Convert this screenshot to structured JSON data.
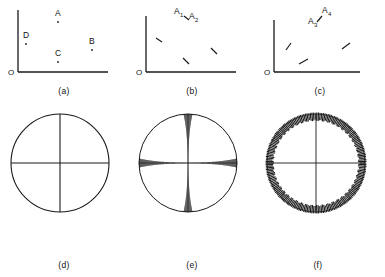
{
  "figure": {
    "title": "",
    "background_color": "#ffffff",
    "ink_color": "#1a1a1a",
    "panel_count": 6
  },
  "panels": [
    {
      "id": "a",
      "caption": "(a)",
      "type": "axes-with-points",
      "origin_label": "O",
      "marker_style": "dot",
      "points": [
        {
          "label": "A",
          "x": 58,
          "y": 22,
          "label_dx": -3,
          "label_dy": -6
        },
        {
          "label": "D",
          "x": 26,
          "y": 44,
          "label_dx": -3,
          "label_dy": -6
        },
        {
          "label": "C",
          "x": 58,
          "y": 62,
          "label_dx": -3,
          "label_dy": -6
        },
        {
          "label": "B",
          "x": 92,
          "y": 50,
          "label_dx": -3,
          "label_dy": -6
        }
      ]
    },
    {
      "id": "b",
      "caption": "(b)",
      "type": "axes-with-dashes",
      "origin_label": "O",
      "marker_style": "dash-backslash",
      "dash_angle_deg": 55,
      "labels": [
        {
          "text": "A",
          "sub": "1",
          "x": 52,
          "y": 16
        },
        {
          "text": "A",
          "sub": "2",
          "x": 66,
          "y": 21
        }
      ],
      "dashes": [
        {
          "x": 31,
          "y": 42
        },
        {
          "x": 58,
          "y": 62
        },
        {
          "x": 86,
          "y": 53
        }
      ]
    },
    {
      "id": "c",
      "caption": "(c)",
      "type": "axes-with-dashes",
      "origin_label": "O",
      "marker_style": "dash-slash",
      "dash_angle_deg": -30,
      "labels": [
        {
          "text": "A",
          "sub": "4",
          "x": 72,
          "y": 15
        },
        {
          "text": "A",
          "sub": "3",
          "x": 58,
          "y": 26
        }
      ],
      "dashes": [
        {
          "x": 33,
          "y": 47
        },
        {
          "x": 47,
          "y": 62
        },
        {
          "x": 90,
          "y": 46
        }
      ]
    },
    {
      "id": "d",
      "caption": "(d)",
      "type": "circle-with-cross",
      "rendering": "plain",
      "circle_radius": 49,
      "cross": "thin"
    },
    {
      "id": "e",
      "caption": "(e)",
      "type": "circle-with-cross",
      "rendering": "thick-cross-bands",
      "circle_radius": 49,
      "cross": "tapered-bands",
      "band_max_width": 9,
      "band_min_width": 1
    },
    {
      "id": "f",
      "caption": "(f)",
      "type": "circle-with-cross",
      "rendering": "hatched-rim",
      "circle_radius": 49,
      "cross": "thin",
      "rim_band_width": 7,
      "rim_hatch_count": 190
    }
  ]
}
